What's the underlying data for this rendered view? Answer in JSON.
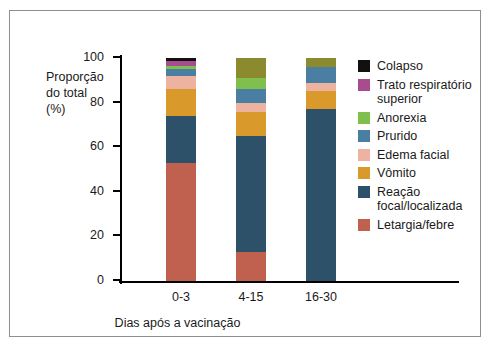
{
  "chart_data": {
    "type": "bar",
    "title": "",
    "subtitle": "",
    "xlabel": "Dias após a vacinação",
    "ylabel": "Proporção do total (%)",
    "ylabel_lines": [
      "Proporção",
      "do total",
      "(%)"
    ],
    "categories": [
      "0-3",
      "4-15",
      "16-30"
    ],
    "ylim": [
      0,
      100
    ],
    "yticks": [
      0,
      20,
      40,
      60,
      80,
      100
    ],
    "ytick_labels": [
      "0",
      "20",
      "40",
      "60",
      "80",
      "100"
    ],
    "grid": false,
    "stacked": true,
    "legend_position": "right",
    "series": [
      {
        "name": "Letargia/febre",
        "color": "#c0614f",
        "values": [
          53,
          13,
          0
        ]
      },
      {
        "name": "Reação focal/localizada",
        "color": "#2d5168",
        "values": [
          21,
          52,
          77
        ]
      },
      {
        "name": "Vômito",
        "color": "#d99a2b",
        "values": [
          12,
          11,
          8
        ]
      },
      {
        "name": "Edema facial",
        "color": "#eeb2a0",
        "values": [
          6,
          4,
          4
        ]
      },
      {
        "name": "Prurido",
        "color": "#4a7fa3",
        "values": [
          3,
          6,
          7
        ]
      },
      {
        "name": "Anorexia",
        "color": "#7fbf4d",
        "values": [
          1.5,
          5,
          0
        ]
      },
      {
        "name": "Trato respiratório superior",
        "color": "#a84b8f",
        "values": [
          2,
          0,
          0
        ]
      },
      {
        "name": "Colapso",
        "color": "#111111",
        "values": [
          1.5,
          0,
          0
        ]
      }
    ],
    "series_extra": [
      {
        "name": "Olivo (topo 4-15 / 16-30)",
        "color": "#8b8a2e",
        "values": [
          0,
          9,
          4
        ]
      }
    ]
  },
  "legend": {
    "items": [
      {
        "label": "Colapso",
        "color": "#111111"
      },
      {
        "label": "Trato respiratório superior",
        "color": "#a84b8f"
      },
      {
        "label": "Anorexia",
        "color": "#7fbf4d"
      },
      {
        "label": "Prurido",
        "color": "#4a7fa3"
      },
      {
        "label": "Edema facial",
        "color": "#eeb2a0"
      },
      {
        "label": "Vômito",
        "color": "#d99a2b"
      },
      {
        "label": "Reação focal/localizada",
        "color": "#2d5168"
      },
      {
        "label": "Letargia/febre",
        "color": "#c0614f"
      }
    ]
  },
  "colors": {
    "frame_border": "#8e8e8e",
    "axis": "#000000",
    "text": "#1a1a1a",
    "background": "#ffffff"
  }
}
